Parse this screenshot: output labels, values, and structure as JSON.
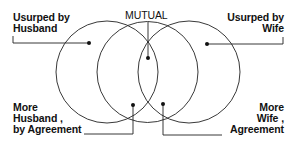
{
  "diagram": {
    "type": "venn-three-circle",
    "labels": {
      "usurped_husband": [
        "Usurped by",
        "Husband"
      ],
      "usurped_wife": [
        "Usurped by",
        "Wife"
      ],
      "mutual": "MUTUAL",
      "more_husband": [
        "More",
        "Husband ,",
        "by Agreement"
      ],
      "more_wife": [
        "More",
        "Wife ,",
        "Agreement"
      ]
    },
    "colors": {
      "line": "#222222",
      "background": "#ffffff"
    }
  }
}
